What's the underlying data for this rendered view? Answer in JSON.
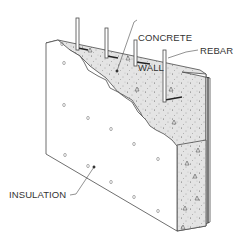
{
  "diagram": {
    "labels": {
      "concrete_wall_line1": "CONCRETE",
      "concrete_wall_line2": "WALL",
      "rebar": "REBAR",
      "insulation": "INSULATION"
    },
    "colors": {
      "line": "#4a4a4a",
      "concrete_fill": "#e2e2e2",
      "insulation_fill": "#ffffff",
      "text": "#333333"
    },
    "components": [
      {
        "id": "insulation",
        "label_key": "insulation"
      },
      {
        "id": "concrete-wall",
        "label_key": "concrete_wall"
      },
      {
        "id": "rebar",
        "label_key": "rebar",
        "count_visible": 4
      }
    ]
  }
}
